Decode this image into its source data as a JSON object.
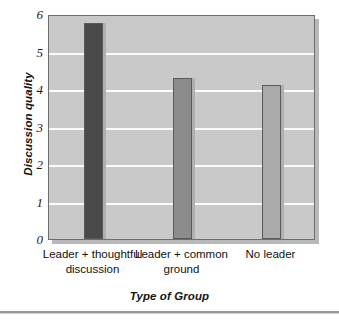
{
  "chart_data": {
    "type": "bar",
    "title": "",
    "xlabel": "Type of Group",
    "ylabel": "Discussion quality",
    "categories": [
      "Leader + thoughtful discussion",
      "Leader + common ground",
      "No leader"
    ],
    "category_lines": [
      [
        "Leader + thoughtful",
        "discussion"
      ],
      [
        "Leader + common",
        "ground"
      ],
      [
        "No leader",
        ""
      ]
    ],
    "values": [
      5.75,
      4.3,
      4.1
    ],
    "ylim": [
      0,
      6
    ],
    "yticks": [
      "0",
      "1",
      "2",
      "3",
      "4",
      "5",
      "6"
    ],
    "ytick_values": [
      0,
      1,
      2,
      3,
      4,
      5,
      6
    ],
    "grid": true,
    "grid_axis": "y",
    "legend": false,
    "bar_colors": [
      "#4a4a4a",
      "#8c8c8c",
      "#aaaaaa"
    ],
    "plot_background": "#c9c9c9",
    "gridline_color": "#fbfbfb",
    "page_background": "#ffffff"
  },
  "axes": {
    "y_title": "Discussion quality",
    "x_title": "Type of Group"
  }
}
